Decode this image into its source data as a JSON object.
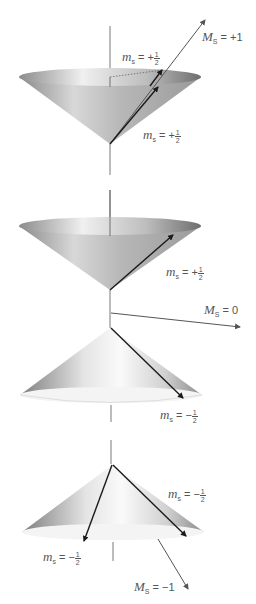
{
  "figure": {
    "panels": [
      {
        "id": "top",
        "total_label": {
          "symbol": "M",
          "subscript": "S",
          "relation": "=",
          "value": "+1"
        },
        "spin_labels": [
          {
            "symbol": "m",
            "subscript": "s",
            "relation": "= +",
            "num": "1",
            "den": "2"
          },
          {
            "symbol": "m",
            "subscript": "s",
            "relation": "= +",
            "num": "1",
            "den": "2"
          }
        ]
      },
      {
        "id": "middle",
        "total_label": {
          "symbol": "M",
          "subscript": "S",
          "relation": "=",
          "value": "0"
        },
        "spin_labels": [
          {
            "symbol": "m",
            "subscript": "s",
            "relation": "= +",
            "num": "1",
            "den": "2"
          },
          {
            "symbol": "m",
            "subscript": "s",
            "relation": "= −",
            "num": "1",
            "den": "2"
          }
        ]
      },
      {
        "id": "bottom",
        "total_label": {
          "symbol": "M",
          "subscript": "S",
          "relation": "=",
          "value": "−1"
        },
        "spin_labels": [
          {
            "symbol": "m",
            "subscript": "s",
            "relation": "= −",
            "num": "1",
            "den": "2"
          },
          {
            "symbol": "m",
            "subscript": "s",
            "relation": "= −",
            "num": "1",
            "den": "2"
          }
        ]
      }
    ],
    "colors": {
      "axis": "#555555",
      "arrow": "#1a1a1a",
      "total_arrow": "#555555",
      "label": "#555555",
      "cone_dark": "#7a7a7a",
      "cone_light": "#f2f2f2"
    }
  }
}
